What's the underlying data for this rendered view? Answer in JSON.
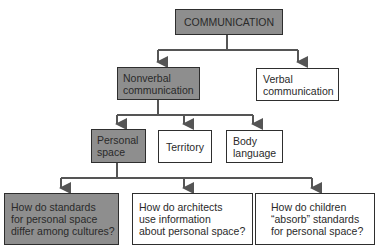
{
  "colors": {
    "highlight_fill": "#8e8e8e",
    "line": "#555555",
    "border": "#2e2e2e"
  },
  "nodes": {
    "root": {
      "label": "COMMUNICATION",
      "highlighted": true
    },
    "nonverbal": {
      "label": "Nonverbal\ncommunication",
      "highlighted": true
    },
    "verbal": {
      "label": "Verbal\ncommunication",
      "highlighted": false
    },
    "personal_space": {
      "label": "Personal\nspace",
      "highlighted": true
    },
    "territory": {
      "label": "Territory",
      "highlighted": false
    },
    "body_language": {
      "label": "Body\nlanguage",
      "highlighted": false
    },
    "q1": {
      "label": "How do standards\nfor personal space\ndiffer among cultures?",
      "highlighted": true
    },
    "q2": {
      "label": "How do architects\nuse information\nabout personal space?",
      "highlighted": false
    },
    "q3": {
      "label": "How do children\n“absorb” standards\nfor personal space?",
      "highlighted": false
    }
  }
}
